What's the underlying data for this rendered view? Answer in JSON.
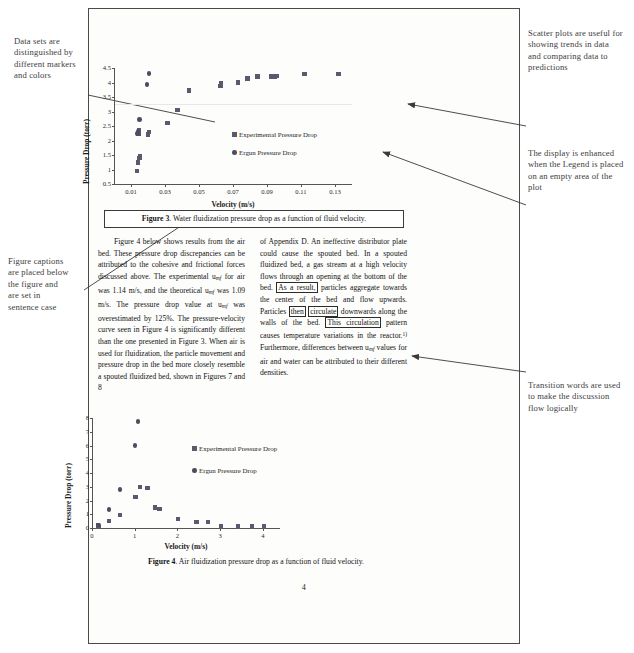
{
  "annotations": {
    "left_markers": "Data sets are distinguished by different markers and colors",
    "left_captions": "Figure captions are placed below the figure and are set in sentence case",
    "right_scatter": "Scatter plots are useful for showing trends in data and comparing data to predictions",
    "right_legend": "The display is enhanced when the Legend is placed on an empty area of the plot",
    "right_transition": "Transition words are used to make the discussion flow logically"
  },
  "captions": {
    "figure3_label": "Figure 3",
    "figure3_text": ". Water fluidization pressure drop as a function of fluid velocity.",
    "figure4_label": "Figure 4",
    "figure4_text": ". Air fluidization pressure drop as a function of fluid velocity."
  },
  "body": {
    "left_p1": "Figure 4 below shows results from the air bed. These pressure drop discrepancies can be attributed to the cohesive and frictional forces discussed above. The experimental u",
    "left_p1_sub1": "mf",
    "left_p1_b": " for air was 1.14 m/s, and the theoretical u",
    "left_p1_sub2": "mf",
    "left_p1_c": " was 1.09 m/s. The pressure drop value at u",
    "left_p1_sub3": "mf",
    "left_p1_d": " was overestimated by 125%. The pressure-velocity curve seen in Figure 4 is significantly different than the one presented in Figure 3. When air is used for fluidization, the particle movement and pressure drop in the bed more closely resemble a spouted fluidized bed, shown in Figures 7 and 8",
    "right_a": "of Appendix D. An ineffective distributor plate could cause the spouted bed. In a spouted fluidized bed, a gas stream at a high velocity flows through an opening at the bottom of the bed.",
    "right_box1": "As a result,",
    "right_b": " particles aggregate towards the center of the bed and flow upwards. Particles",
    "right_box2": "then",
    "right_box3": "circulate",
    "right_c": " downwards along the walls of the bed.",
    "right_box4": "This circulation",
    "right_d": " pattern causes temperature variations in the reactor.",
    "right_sup": "1)",
    "right_e": " Furthermore, differences between u",
    "right_sub1": "mf",
    "right_f": " values for air and water can be attributed to their different densities."
  },
  "page_number": "4",
  "chart_data": [
    {
      "id": "figure3",
      "type": "scatter",
      "title": "",
      "xlabel": "Velocity (m/s)",
      "ylabel": "Pressure Drop (torr)",
      "xlim": [
        0.0,
        0.14
      ],
      "ylim": [
        0.5,
        4.5
      ],
      "xticks": [
        "0.01",
        "0.03",
        "0.05",
        "0.07",
        "0.09",
        "0.11",
        "0.13"
      ],
      "xtick_values": [
        0.01,
        0.03,
        0.05,
        0.07,
        0.09,
        0.11,
        0.13
      ],
      "yticks": [
        "0.5",
        "1",
        "1.5",
        "2",
        "2.5",
        "3",
        "3.5",
        "4",
        "4.5"
      ],
      "ytick_values": [
        0.5,
        1,
        1.5,
        2,
        2.5,
        3,
        3.5,
        4,
        4.5
      ],
      "grid": false,
      "legend_position": "center-right-inside",
      "series": [
        {
          "name": "Experimental Pressure Drop",
          "marker": "square",
          "color": "#5a5a6e",
          "points": [
            [
              0.0135,
              0.95
            ],
            [
              0.014,
              1.25
            ],
            [
              0.015,
              1.4
            ],
            [
              0.0152,
              1.47
            ],
            [
              0.0145,
              2.25
            ],
            [
              0.0148,
              2.35
            ],
            [
              0.02,
              2.2
            ],
            [
              0.0205,
              2.3
            ],
            [
              0.0315,
              2.6
            ],
            [
              0.0375,
              3.05
            ],
            [
              0.044,
              3.72
            ],
            [
              0.0625,
              3.88
            ],
            [
              0.063,
              3.97
            ],
            [
              0.073,
              4.0
            ],
            [
              0.0785,
              4.13
            ],
            [
              0.0845,
              4.2
            ],
            [
              0.0925,
              4.2
            ],
            [
              0.0945,
              4.2
            ],
            [
              0.0955,
              4.22
            ],
            [
              0.112,
              4.3
            ],
            [
              0.132,
              4.3
            ]
          ]
        },
        {
          "name": "Ergun Pressure Drop",
          "marker": "circle",
          "color": "#4d4d5f",
          "points": [
            [
              0.0138,
              2.25
            ],
            [
              0.014,
              2.32
            ],
            [
              0.015,
              2.72
            ],
            [
              0.0195,
              3.93
            ],
            [
              0.0205,
              4.32
            ]
          ]
        }
      ]
    },
    {
      "id": "figure4",
      "type": "scatter",
      "title": "",
      "xlabel": "Velocity (m/s)",
      "ylabel": "Pressure Drop (torr)",
      "xlim": [
        0,
        4.4
      ],
      "ylim": [
        0,
        8
      ],
      "xticks": [
        "0",
        "1",
        "2",
        "3",
        "4"
      ],
      "xtick_values": [
        0,
        1,
        2,
        3,
        4
      ],
      "yticks": [
        "0",
        "1",
        "2",
        "3",
        "4",
        "5",
        "6",
        "7",
        "8"
      ],
      "ytick_values": [
        0,
        1,
        2,
        3,
        4,
        5,
        6,
        7,
        8
      ],
      "grid": false,
      "legend_position": "center-right-inside",
      "series": [
        {
          "name": "Experimental Pressure Drop",
          "marker": "square",
          "color": "#5a5a6e",
          "points": [
            [
              0.14,
              0.18
            ],
            [
              0.15,
              0.08
            ],
            [
              0.4,
              0.5
            ],
            [
              0.65,
              0.95
            ],
            [
              1.02,
              2.25
            ],
            [
              1.13,
              3.0
            ],
            [
              1.3,
              2.93
            ],
            [
              1.47,
              1.5
            ],
            [
              1.58,
              1.4
            ],
            [
              2.02,
              0.65
            ],
            [
              2.45,
              0.45
            ],
            [
              2.72,
              0.42
            ],
            [
              3.02,
              0.12
            ],
            [
              3.42,
              0.12
            ],
            [
              3.75,
              0.12
            ],
            [
              4.02,
              0.12
            ]
          ]
        },
        {
          "name": "Ergun Pressure Drop",
          "marker": "circle",
          "color": "#4d4d5f",
          "points": [
            [
              0.15,
              0.22
            ],
            [
              0.4,
              1.35
            ],
            [
              0.66,
              2.8
            ],
            [
              1.0,
              6.0
            ],
            [
              1.08,
              7.75
            ]
          ]
        }
      ]
    }
  ]
}
